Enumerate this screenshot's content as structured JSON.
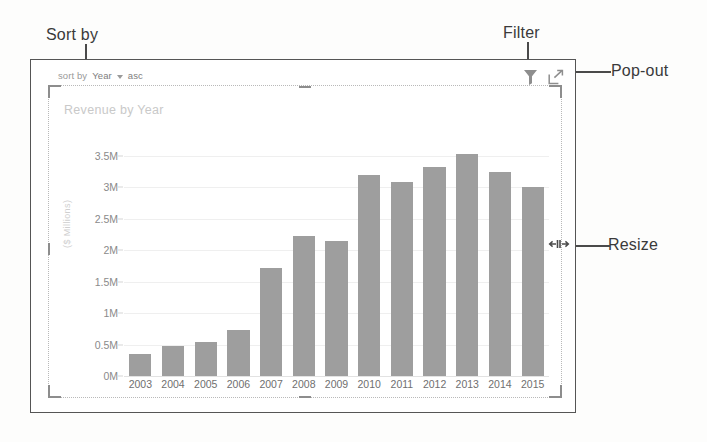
{
  "annotations": [
    {
      "id": "sort",
      "label": "Sort by"
    },
    {
      "id": "filter",
      "label": "Filter"
    },
    {
      "id": "popout",
      "label": "Pop-out"
    },
    {
      "id": "resize",
      "label": "Resize"
    }
  ],
  "visual_header": {
    "sort_by_label": "sort by",
    "sort_field": "Year",
    "sort_direction": "asc",
    "caret_icon": "chevron-down-icon",
    "filter_icon": "funnel-icon",
    "popout_icon": "pop-out-arrow-icon"
  },
  "chart_data": {
    "type": "bar",
    "title": "Revenue by Year",
    "xlabel": "",
    "ylabel": "($ Millions)",
    "categories": [
      "2003",
      "2004",
      "2005",
      "2006",
      "2007",
      "2008",
      "2009",
      "2010",
      "2011",
      "2012",
      "2013",
      "2014",
      "2015"
    ],
    "values": [
      0.35,
      0.47,
      0.54,
      0.73,
      1.72,
      2.22,
      2.15,
      3.2,
      3.08,
      3.32,
      3.53,
      3.24,
      3.0
    ],
    "ylim": [
      0,
      3.75
    ],
    "yticks": [
      0,
      0.5,
      1,
      1.5,
      2,
      2.5,
      3,
      3.5
    ],
    "ytick_labels": [
      "0M",
      "0.5M",
      "1M",
      "1.5M",
      "2M",
      "2.5M",
      "3M",
      "3.5M"
    ],
    "grid": true,
    "legend": "none",
    "bar_color": "#9e9e9e"
  },
  "colors": {
    "bar": "#9e9e9e",
    "gridline": "#efefef",
    "annotation_text": "#3a3a3a",
    "axis_text": "#7a7a7a",
    "title_text": "#c9c9c9"
  }
}
